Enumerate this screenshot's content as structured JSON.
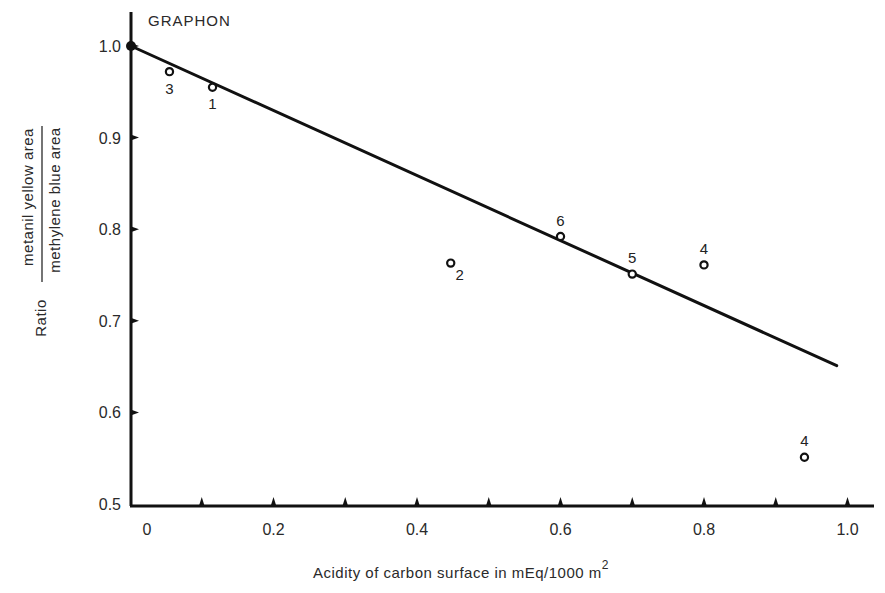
{
  "chart_data": {
    "type": "scatter",
    "title": "GRAPHON",
    "xlabel": "Acidity of carbon surface in mEq/1000 m",
    "xlabel_superscript": "2",
    "ylabel_prefix": "Ratio",
    "ylabel_numerator": "metanil yellow area",
    "ylabel_denominator": "methylene blue area",
    "xlim": [
      0,
      1.0
    ],
    "ylim": [
      0.5,
      1.0
    ],
    "grid": false,
    "x_ticks": [
      0,
      0.1,
      0.2,
      0.3,
      0.4,
      0.5,
      0.6,
      0.7,
      0.8,
      0.9,
      1.0
    ],
    "x_tick_labels": [
      {
        "value": 0,
        "label": "0"
      },
      {
        "value": 0.2,
        "label": "0.2"
      },
      {
        "value": 0.4,
        "label": "0.4"
      },
      {
        "value": 0.6,
        "label": "0.6"
      },
      {
        "value": 0.8,
        "label": "0.8"
      },
      {
        "value": 1.0,
        "label": "1.0"
      }
    ],
    "y_tick_labels": [
      {
        "value": 1.0,
        "label": "1.0"
      },
      {
        "value": 0.9,
        "label": "0.9"
      },
      {
        "value": 0.8,
        "label": "0.8"
      },
      {
        "value": 0.7,
        "label": "0.7"
      },
      {
        "value": 0.6,
        "label": "0.6"
      },
      {
        "value": 0.5,
        "label": "0.5"
      }
    ],
    "points": [
      {
        "x": 0.0,
        "y": 1.0,
        "label": "",
        "filled": true
      },
      {
        "x": 0.055,
        "y": 0.972,
        "label": "3",
        "label_pos": "below"
      },
      {
        "x": 0.115,
        "y": 0.955,
        "label": "1",
        "label_pos": "below"
      },
      {
        "x": 0.447,
        "y": 0.763,
        "label": "2",
        "label_pos": "below-right"
      },
      {
        "x": 0.6,
        "y": 0.792,
        "label": "6",
        "label_pos": "above"
      },
      {
        "x": 0.7,
        "y": 0.751,
        "label": "5",
        "label_pos": "above"
      },
      {
        "x": 0.8,
        "y": 0.761,
        "label": "4",
        "label_pos": "above"
      },
      {
        "x": 0.94,
        "y": 0.551,
        "label": "4",
        "label_pos": "above"
      }
    ],
    "fit_line": {
      "x": [
        0.0,
        0.985
      ],
      "y": [
        1.0,
        0.651
      ]
    }
  }
}
